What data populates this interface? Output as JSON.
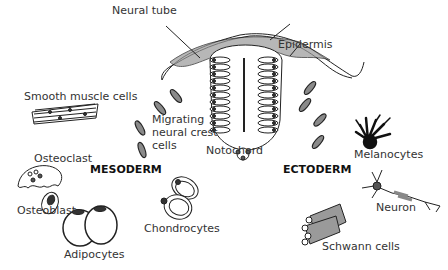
{
  "labels": {
    "neural_tube": "Neural tube",
    "epidermis": "Epidermis",
    "smooth_muscle": "Smooth muscle cells",
    "migrating_1": "Migrating",
    "migrating_2": "neural crest",
    "migrating_3": "cells",
    "notochord": "Notochord",
    "osteoclast": "Osteoclast",
    "mesoderm": "MESODERM",
    "osteoblast": "Osteoblast",
    "chondrocytes": "Chondrocytes",
    "adipocytes": "Adipocytes",
    "ectoderm": "ECTODERM",
    "melanocytes": "Melanocytes",
    "neuron": "Neuron",
    "schwann": "Schwann cells"
  },
  "colors": {
    "line": "#222222",
    "crest_fill": "#8a8a8a",
    "cell_fill": "#ffffff",
    "nucleus": "#333333",
    "melanocyte": "#111111"
  }
}
